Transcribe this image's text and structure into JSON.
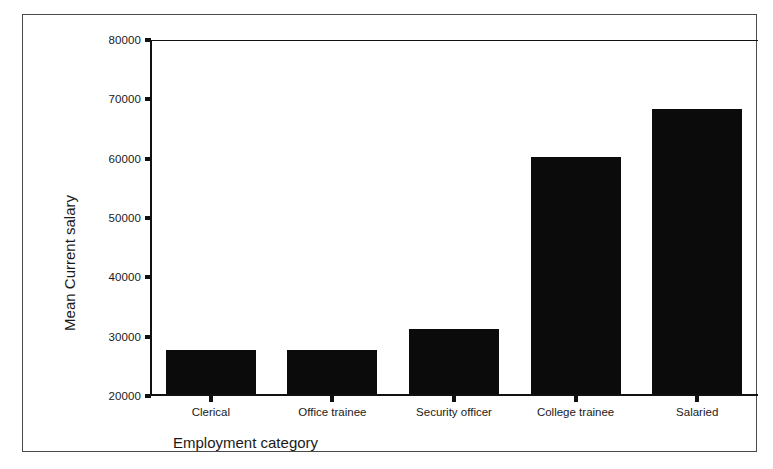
{
  "chart_data": {
    "type": "bar",
    "title": "",
    "subtitle": "",
    "xlabel": "Employment category",
    "ylabel": "Mean Current salary",
    "categories": [
      "Clerical",
      "Office trainee",
      "Security officer",
      "College trainee",
      "Salaried"
    ],
    "values": [
      27500,
      27500,
      31000,
      60000,
      68000
    ],
    "series": [
      {
        "name": "Mean Current salary",
        "values": [
          27500,
          27500,
          31000,
          60000,
          68000
        ]
      }
    ],
    "ylim": [
      20000,
      80000
    ],
    "yticks": [
      20000,
      30000,
      40000,
      50000,
      60000,
      70000,
      80000
    ],
    "ytick_labels": [
      "20000",
      "30000",
      "40000",
      "50000",
      "60000",
      "70000",
      "80000"
    ],
    "grid": false,
    "legend": false,
    "legend_position": "none",
    "bar_color": "#0b0b0b",
    "axis_color": "#111111",
    "background_color": "#ffffff",
    "frame_border_color": "#4a4a4a",
    "annotations": []
  }
}
